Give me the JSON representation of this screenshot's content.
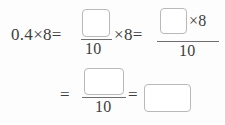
{
  "worksheet": {
    "type": "math-expression",
    "subject": "decimal to fraction multiplication",
    "background_color": "#fdfdfd",
    "text_color": "#3d3d3d",
    "box_border_color": "#b9b9b9",
    "rule_color": "#6f6f6f"
  },
  "line1": {
    "lhs": "0.4×8=",
    "fraction1": {
      "numerator_placeholder": "",
      "denominator": "10"
    },
    "middle": "×8=",
    "fraction2": {
      "numerator_box_placeholder": "",
      "numerator_suffix": "×8",
      "denominator": "10"
    }
  },
  "line2": {
    "equals_first": "=",
    "fraction3": {
      "numerator_placeholder": "",
      "denominator": "10"
    },
    "equals_second": "=",
    "final_answer_placeholder": ""
  }
}
